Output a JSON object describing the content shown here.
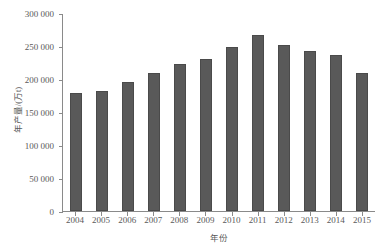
{
  "chart_data": {
    "type": "bar",
    "title": "",
    "xlabel": "年份",
    "ylabel": "年产量/(万t)",
    "categories": [
      "2004",
      "2005",
      "2006",
      "2007",
      "2008",
      "2009",
      "2010",
      "2011",
      "2012",
      "2013",
      "2014",
      "2015"
    ],
    "values": [
      179000,
      182000,
      196000,
      209000,
      222000,
      230000,
      249000,
      267000,
      251000,
      242000,
      237000,
      209000
    ],
    "ylim": [
      0,
      300000
    ],
    "ytick_values": [
      0,
      50000,
      100000,
      150000,
      200000,
      250000,
      300000
    ],
    "ytick_labels": [
      "0",
      "50 000",
      "100 000",
      "150 000",
      "200 000",
      "250 000",
      "300 000"
    ],
    "grid": false,
    "legend": null,
    "series": [
      {
        "name": "年产量",
        "values": [
          179000,
          182000,
          196000,
          209000,
          222000,
          230000,
          249000,
          267000,
          251000,
          242000,
          237000,
          209000
        ]
      }
    ],
    "bar_color": "#595959",
    "axis_color": "#8a8a8a",
    "text_color": "#5a5a5a"
  }
}
